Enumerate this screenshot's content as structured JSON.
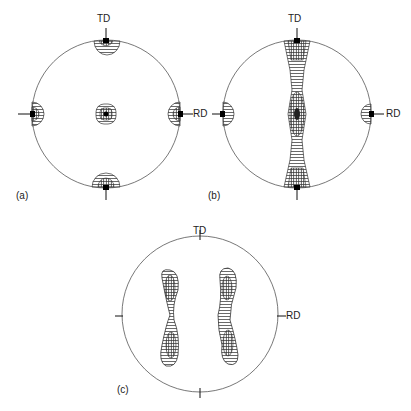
{
  "figure": {
    "type": "pole_figures",
    "panels": [
      {
        "id": "a",
        "label": "(a)",
        "axis_top": "TD",
        "axis_right": "RD",
        "description": "Cube texture: concentrated poles at centre, TD and RD directions"
      },
      {
        "id": "b",
        "label": "(b)",
        "axis_top": "TD",
        "axis_right": "RD",
        "description": "Poles spread along vertical TD band with RD poles at edges"
      },
      {
        "id": "c",
        "label": "(c)",
        "axis_top": "TD",
        "axis_right": "RD",
        "description": "Two curved elongated pole bands symmetric about TD axis"
      }
    ]
  },
  "colors": {
    "line": "#555555",
    "contour": "#333333",
    "core": "#000000"
  }
}
